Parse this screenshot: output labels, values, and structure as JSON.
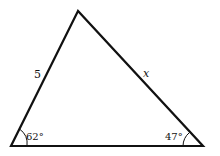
{
  "diagram": {
    "type": "triangle",
    "vertices": {
      "top": [
        78,
        11
      ],
      "bottom_left": [
        11,
        146
      ],
      "bottom_right": [
        203,
        146
      ]
    },
    "labels": {
      "left_side": "5",
      "right_side": "x",
      "bottom_left_angle": "62°",
      "bottom_right_angle": "47°"
    },
    "colors": {
      "stroke": "#111111",
      "background": "#ffffff"
    }
  }
}
